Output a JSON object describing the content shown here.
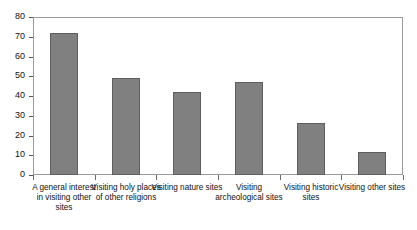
{
  "chart_data": {
    "type": "bar",
    "title": "",
    "subtitle": "",
    "xlabel": "",
    "ylabel": "",
    "ylim": [
      0,
      80
    ],
    "yticks": [
      0,
      10,
      20,
      30,
      40,
      50,
      60,
      70,
      80
    ],
    "ytick_labels": [
      "0",
      "10",
      "20",
      "30",
      "40",
      "50",
      "60",
      "70",
      "80"
    ],
    "grid": false,
    "legend": false,
    "legend_position": "none",
    "bar_color": "#808080",
    "bar_edge_color": "#5e5e5e",
    "frame_color": "#9a9a9a",
    "categories": [
      "A general interest in visiting other sites",
      "Visiting holy places of other religions",
      "Visiting nature sites",
      "Visiting archeological sites",
      "Visiting historic sites",
      "Visiting other sites"
    ],
    "values": [
      72,
      49,
      42,
      47,
      26.5,
      11.5
    ],
    "series": [
      {
        "name": "",
        "values": [
          72,
          49,
          42,
          47,
          26.5,
          11.5
        ]
      }
    ]
  }
}
